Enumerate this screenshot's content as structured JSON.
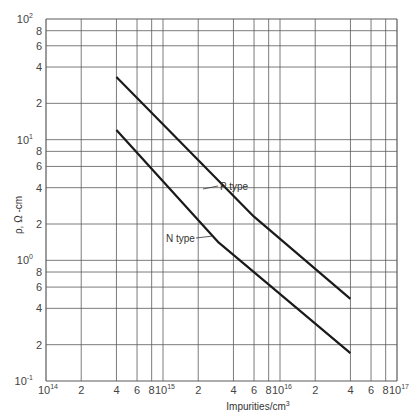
{
  "chart_data": {
    "type": "line",
    "title": "",
    "xlabel": "Impurities/cm³",
    "ylabel": "ρ, Ω-cm",
    "xscale": "log",
    "yscale": "log",
    "xlim": [
      100000000000000.0,
      1e+17
    ],
    "ylim": [
      0.1,
      100
    ],
    "grid": true,
    "legend": "none (inline annotations)",
    "x_ticks": [
      {
        "value": 100000000000000.0,
        "label": "10",
        "exp": "14"
      },
      {
        "value": 200000000000000.0,
        "label": "2"
      },
      {
        "value": 400000000000000.0,
        "label": "4"
      },
      {
        "value": 600000000000000.0,
        "label": "6"
      },
      {
        "value": 800000000000000.0,
        "label": "8"
      },
      {
        "value": 1000000000000000.0,
        "label": "10",
        "exp": "15"
      },
      {
        "value": 2000000000000000.0,
        "label": "2"
      },
      {
        "value": 4000000000000000.0,
        "label": "4"
      },
      {
        "value": 6000000000000000.0,
        "label": "6"
      },
      {
        "value": 8000000000000000.0,
        "label": "8"
      },
      {
        "value": 1e+16,
        "label": "10",
        "exp": "16"
      },
      {
        "value": 2e+16,
        "label": "2"
      },
      {
        "value": 4e+16,
        "label": "4"
      },
      {
        "value": 6e+16,
        "label": "6"
      },
      {
        "value": 8e+16,
        "label": "8"
      },
      {
        "value": 1e+17,
        "label": "10",
        "exp": "17"
      }
    ],
    "y_ticks": [
      {
        "value": 100,
        "label": "10",
        "exp": "2"
      },
      {
        "value": 80,
        "label": "8"
      },
      {
        "value": 60,
        "label": "6"
      },
      {
        "value": 40,
        "label": "4"
      },
      {
        "value": 20,
        "label": "2"
      },
      {
        "value": 10,
        "label": "10",
        "exp": "1"
      },
      {
        "value": 8,
        "label": "8"
      },
      {
        "value": 6,
        "label": "6"
      },
      {
        "value": 4,
        "label": "4"
      },
      {
        "value": 2,
        "label": "2"
      },
      {
        "value": 1,
        "label": "10",
        "exp": "0"
      },
      {
        "value": 0.8,
        "label": "8"
      },
      {
        "value": 0.6,
        "label": "6"
      },
      {
        "value": 0.4,
        "label": "4"
      },
      {
        "value": 0.2,
        "label": "2"
      },
      {
        "value": 0.1,
        "label": "10",
        "exp": "-1"
      }
    ],
    "series": [
      {
        "name": "P type",
        "x": [
          400000000000000.0,
          6000000000000000.0,
          4e+16
        ],
        "y": [
          33,
          2.3,
          0.48
        ]
      },
      {
        "name": "N type",
        "x": [
          400000000000000.0,
          3000000000000000.0,
          4e+16
        ],
        "y": [
          12,
          1.4,
          0.17
        ]
      }
    ],
    "annotations": [
      {
        "text": "P  type",
        "series": "P type",
        "arrow_to": {
          "x": 4500000000000000.0,
          "y": 3.9
        },
        "label_pos": {
          "x": 6000000000000000.0,
          "y": 3.7
        }
      },
      {
        "text": "N  type",
        "series": "N type",
        "arrow_to": {
          "x": 2600000000000000.0,
          "y": 1.7
        },
        "label_pos": {
          "x": 1300000000000000.0,
          "y": 1.65
        }
      }
    ]
  },
  "labels": {
    "xlabel_main": "Impurities/cm",
    "xlabel_sup": "3",
    "ylabel": "ρ, Ω -cm",
    "p_type": "P  type",
    "n_type": "N  type"
  },
  "colors": {
    "grid": "#5a5a5a",
    "curve": "#1a1a1a",
    "text": "#444444"
  }
}
